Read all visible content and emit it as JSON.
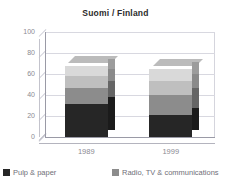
{
  "chart_data": {
    "type": "bar",
    "subtype": "stacked-3d-column",
    "title": "Suomi / Finland",
    "xlabel": "",
    "ylabel": "",
    "categories": [
      "1989",
      "1999"
    ],
    "ylim": [
      0,
      100
    ],
    "yticks": [
      "0",
      "20",
      "40",
      "60",
      "80",
      "100"
    ],
    "grid": true,
    "legend_position": "bottom",
    "series": [
      {
        "name": "Pulp & paper",
        "color": "#262626",
        "values": [
          31,
          21
        ]
      },
      {
        "name": "Radio, TV & communications",
        "color": "#8c8c8c",
        "values": [
          16,
          19
        ]
      },
      {
        "name": "series-3",
        "color": "#bfbfbf",
        "values": [
          11,
          13
        ]
      },
      {
        "name": "series-4",
        "color": "#d9d9d9",
        "values": [
          10,
          12
        ]
      }
    ],
    "totals": [
      68,
      65
    ]
  },
  "legend": {
    "items": [
      {
        "label": "Pulp & paper",
        "color": "#262626"
      },
      {
        "label": "Radio, TV & communications",
        "color": "#8c8c8c"
      }
    ]
  },
  "colors": {
    "background": "#ffffff",
    "grid": "#d8d8e0",
    "axis": "#9a9aa6",
    "tick_text": "#8a8a92",
    "title_text": "#2b2b2b",
    "legend_text": "#6f6f78"
  }
}
